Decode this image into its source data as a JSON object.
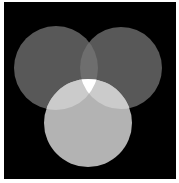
{
  "image": {
    "description": "Three overlapping circles (additive light venn diagram) on black background",
    "background_color": "#000000",
    "circles": [
      {
        "name": "top-left",
        "cx": 56,
        "cy": 68,
        "r": 42,
        "color": "#585858"
      },
      {
        "name": "top-right",
        "cx": 121,
        "cy": 68,
        "r": 41,
        "color": "#585858"
      },
      {
        "name": "bottom",
        "cx": 88,
        "cy": 123,
        "r": 44,
        "color": "#b3b3b3"
      }
    ],
    "overlap_colors": {
      "top_pair": "#6e6e6e",
      "bottom_with_side": "#cbcbcb",
      "all_three": "#ffffff"
    }
  }
}
